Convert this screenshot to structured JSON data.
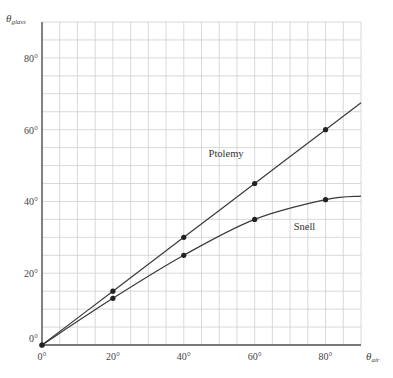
{
  "chart_data": {
    "type": "line",
    "title": "",
    "xlabel": "θ_air",
    "ylabel": "θ_glass",
    "xlabel_main": "θ",
    "xlabel_sub": "air",
    "ylabel_main": "θ",
    "ylabel_sub": "glass",
    "xlim": [
      0,
      90
    ],
    "ylim": [
      0,
      90
    ],
    "grid": true,
    "grid_step_deg": 5,
    "x_ticks": [
      0,
      20,
      40,
      60,
      80
    ],
    "y_ticks": [
      0,
      20,
      40,
      60,
      80
    ],
    "x_tick_labels": [
      "0°",
      "20°",
      "40°",
      "60°",
      "80°"
    ],
    "y_tick_labels": [
      "0°",
      "20°",
      "40°",
      "60°",
      "80°"
    ],
    "legend": "inline labels",
    "series": [
      {
        "name": "Ptolemy",
        "x": [
          0,
          20,
          40,
          60,
          80
        ],
        "values": [
          0,
          15,
          30,
          45,
          60
        ],
        "curve_end": [
          90,
          67.5
        ],
        "label_pos": [
          47,
          52.5
        ]
      },
      {
        "name": "Snell",
        "x": [
          0,
          20,
          40,
          60,
          80
        ],
        "values": [
          0,
          13,
          25,
          35,
          40.5
        ],
        "curve_end": [
          90,
          41.5
        ],
        "label_pos": [
          71,
          32
        ]
      }
    ]
  },
  "colors": {
    "grid": "#cfcfcf",
    "axis": "#555555",
    "line": "#3a3a3a",
    "marker": "#222222"
  }
}
